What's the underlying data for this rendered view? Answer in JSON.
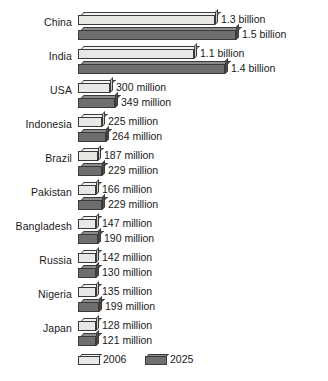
{
  "chart_data": {
    "type": "bar",
    "orientation": "horizontal",
    "title": "",
    "subtitle": "",
    "xlabel": "",
    "ylabel": "",
    "grid": false,
    "legend_position": "bottom",
    "axis_range_millions": [
      0,
      1500
    ],
    "categories": [
      "China",
      "India",
      "USA",
      "Indonesia",
      "Brazil",
      "Pakistan",
      "Bangladesh",
      "Russia",
      "Nigeria",
      "Japan"
    ],
    "series": [
      {
        "name": "2006",
        "color": "#e8e8e6",
        "values": [
          1300,
          1100,
          300,
          225,
          187,
          166,
          147,
          142,
          135,
          128
        ],
        "labels": [
          "1.3 billion",
          "1.1 billion",
          "300 million",
          "225 million",
          "187 million",
          "166 million",
          "147 million",
          "142 million",
          "135 million",
          "128 million"
        ]
      },
      {
        "name": "2025",
        "color": "#6e6e6e",
        "values": [
          1500,
          1400,
          349,
          264,
          229,
          229,
          190,
          130,
          199,
          121
        ],
        "labels": [
          "1.5 billion",
          "1.4 billion",
          "349 million",
          "264 million",
          "229 million",
          "229 million",
          "190 million",
          "130 million",
          "199 million",
          "121 million"
        ]
      }
    ]
  },
  "legend": {
    "items": [
      {
        "label": "2006",
        "color": "#e8e8e6"
      },
      {
        "label": "2025",
        "color": "#6e6e6e"
      }
    ]
  }
}
